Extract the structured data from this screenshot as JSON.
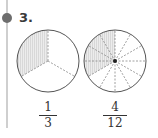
{
  "problem": {
    "number_label": "3.",
    "bullet_color": "#6d6d6d"
  },
  "figures": [
    {
      "name": "circle-thirds",
      "parts": 3,
      "shaded": 1,
      "numerator": "1",
      "denominator": "3"
    },
    {
      "name": "circle-twelfths",
      "parts": 12,
      "shaded": 4,
      "numerator": "4",
      "denominator": "12"
    }
  ],
  "colors": {
    "shade": "#e4e4e4",
    "outline": "#555555",
    "divider": "#888888"
  }
}
